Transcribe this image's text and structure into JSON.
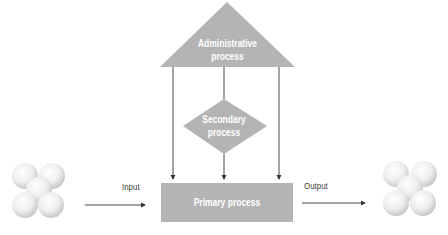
{
  "diagram": {
    "header": "",
    "administrative": {
      "label_line1": "Administrative",
      "label_line2": "process"
    },
    "secondary": {
      "label_line1": "Secondary",
      "label_line2": "process"
    },
    "primary": {
      "label": "Primary process"
    },
    "input": {
      "label": "Input"
    },
    "output": {
      "label": "Output"
    },
    "colors": {
      "shape_fill": "#b4b4b4",
      "arrow": "#333333",
      "label_text": "#ffffff",
      "flow_text": "#444444"
    }
  }
}
